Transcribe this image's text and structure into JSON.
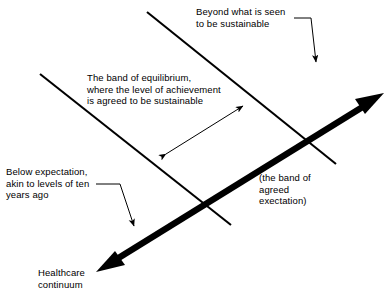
{
  "diagram": {
    "background_color": "#ffffff",
    "ink_color": "#000000",
    "labels": {
      "beyond_sustainable": "Beyond what is seen\nto be sustainable",
      "band_of_equilibrium": "The band of equilibrium,\nwhere the level of achievement\nis agreed to be sustainable",
      "below_expectation": "Below expectation,\nakin to levels of ten\nyears ago",
      "band_of_agreed_expectation": "(the band of\nagreed\nexectation)",
      "healthcare_continuum": "Healthcare\ncontinuum"
    },
    "elements": {
      "upper_band_line": "upper-boundary-line",
      "lower_band_line": "lower-boundary-line",
      "continuum_arrow": "thick-double-headed-continuum-arrow",
      "band_width_arrow": "double-headed-band-width-arrow",
      "beyond_leader": "beyond-sustainable-leader-arrow",
      "below_leader": "below-expectation-leader-arrow"
    }
  }
}
